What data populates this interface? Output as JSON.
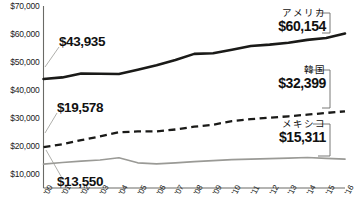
{
  "chart_data": {
    "type": "line",
    "title": "",
    "xlabel": "",
    "ylabel": "",
    "ylim": [
      5000,
      70000
    ],
    "yticks": [
      10000,
      20000,
      30000,
      40000,
      50000,
      60000,
      70000
    ],
    "ytick_labels": [
      "$10,000",
      "$20,000",
      "$30,000",
      "$40,000",
      "$50,000",
      "$60,000",
      "$70,000"
    ],
    "grid": false,
    "legend_position": "right-inline-callout",
    "x": [
      "00",
      "01",
      "02",
      "03",
      "04",
      "05",
      "06",
      "07",
      "08",
      "09",
      "10",
      "11",
      "12",
      "13",
      "14",
      "15",
      "16"
    ],
    "xtick_labels": [
      "'00",
      "'01",
      "'02",
      "'03",
      "'04",
      "'05",
      "'06",
      "'07",
      "'08",
      "'09",
      "'10",
      "'11",
      "'12",
      "'13",
      "'14",
      "'15",
      "'16"
    ],
    "series": [
      {
        "name": "アメリカ",
        "style": "solid-thick-black",
        "color": "#1a1a18",
        "start_label": "$43,935",
        "end_label": "$60,154",
        "values": [
          43935,
          44500,
          45900,
          45800,
          45700,
          47200,
          48800,
          50700,
          52900,
          53100,
          54400,
          55700,
          56200,
          56900,
          57900,
          58600,
          60154
        ]
      },
      {
        "name": "韓国",
        "style": "dashed-black",
        "color": "#1a1a18",
        "start_label": "$19,578",
        "end_label": "$32,399",
        "values": [
          19578,
          20600,
          22100,
          23400,
          24900,
          25200,
          25200,
          25900,
          26900,
          27600,
          28900,
          29600,
          30100,
          30600,
          31200,
          31800,
          32399
        ]
      },
      {
        "name": "メキシコ",
        "style": "solid-gray",
        "color": "#9a9a96",
        "start_label": "$13,550",
        "end_label": "$15,311",
        "values": [
          13550,
          14100,
          14600,
          15000,
          15800,
          14000,
          13600,
          14000,
          14400,
          14800,
          15100,
          15300,
          15500,
          15700,
          15900,
          15600,
          15311
        ]
      }
    ],
    "callouts": [
      {
        "name": "アメリカ",
        "value": "$60,154"
      },
      {
        "name": "韓国",
        "value": "$32,399"
      },
      {
        "name": "メキシコ",
        "value": "$15,311"
      }
    ],
    "start_annotations": [
      {
        "label": "$43,935",
        "series": "アメリカ"
      },
      {
        "label": "$19,578",
        "series": "韓国"
      },
      {
        "label": "$13,550",
        "series": "メキシコ"
      }
    ],
    "axis_color": "#6a6a66"
  }
}
